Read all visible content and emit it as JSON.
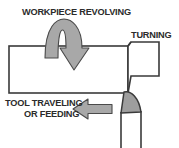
{
  "diagram": {
    "title_hidden": "Lathe turning operation schematic",
    "background_color": "#ffffff",
    "outline_color": "#3a3a3a",
    "arrow_fill_color": "#a8a8a8",
    "arrow_outline_color": "#4a4a4a",
    "tool_fill_color": "#9e9e9e",
    "workpiece_fill_color": "#ffffff",
    "text_color": "#2b2b2b"
  },
  "labels": {
    "workpiece_revolving": "WORKPIECE REVOLVING",
    "turning": "TURNING",
    "tool_traveling_line1": "TOOL TRAVELING",
    "tool_traveling_line2": "OR FEEDING"
  },
  "elements": {
    "rotation_arrow_name": "workpiece-rotation-arrow",
    "feed_arrow_name": "tool-feed-arrow",
    "workpiece_name": "workpiece-body",
    "turned_section_name": "turned-reduced-diameter-section",
    "tool_tip_name": "cutting-tool-tip",
    "tool_shank_name": "cutting-tool-shank"
  }
}
